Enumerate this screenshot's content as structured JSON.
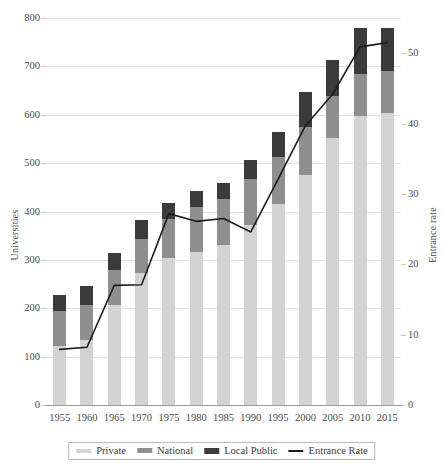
{
  "chart_data": {
    "type": "bar",
    "title": "",
    "subtitle": "",
    "xlabel": "",
    "ylabel": "Universities",
    "y2label": "Entrance rate",
    "grid": true,
    "legend_position": "bottom",
    "categories": [
      "1955",
      "1960",
      "1965",
      "1970",
      "1975",
      "1980",
      "1985",
      "1990",
      "1995",
      "2000",
      "2005",
      "2010",
      "2015"
    ],
    "ylim": [
      0,
      800
    ],
    "yticks": [
      0,
      100,
      200,
      300,
      400,
      500,
      600,
      700,
      800
    ],
    "y2lim": [
      0,
      55
    ],
    "y2ticks": [
      0,
      10,
      20,
      30,
      40,
      50
    ],
    "stacked": true,
    "series": [
      {
        "name": "Private",
        "axis": "left",
        "type": "bar",
        "color": "#d3d3d3",
        "values": [
          122,
          134,
          207,
          272,
          303,
          316,
          330,
          372,
          415,
          475,
          551,
          598,
          604
        ]
      },
      {
        "name": "National",
        "axis": "left",
        "type": "bar",
        "color": "#8f8f8f",
        "values": [
          72,
          72,
          72,
          72,
          81,
          93,
          95,
          96,
          98,
          99,
          87,
          86,
          86
        ]
      },
      {
        "name": "Local Public",
        "axis": "left",
        "type": "bar",
        "color": "#3b3b3b",
        "values": [
          34,
          39,
          35,
          38,
          34,
          34,
          34,
          39,
          52,
          72,
          76,
          95,
          89
        ]
      },
      {
        "name": "Entrance Rate",
        "axis": "right",
        "type": "line",
        "color": "#1c1c1c",
        "values": [
          7.9,
          8.2,
          17.0,
          17.1,
          27.2,
          26.1,
          26.5,
          24.6,
          32.1,
          39.7,
          44.2,
          50.9,
          51.5
        ]
      }
    ],
    "totals": [
      228,
      245,
      314,
      382,
      418,
      443,
      459,
      507,
      565,
      646,
      714,
      779,
      779
    ]
  },
  "legend": {
    "items": [
      {
        "label": "Private",
        "icon": "legend-swatch-private"
      },
      {
        "label": "National",
        "icon": "legend-swatch-national"
      },
      {
        "label": "Local Public",
        "icon": "legend-swatch-local-public"
      },
      {
        "label": "Entrance Rate",
        "icon": "legend-swatch-entrance-rate"
      }
    ]
  }
}
